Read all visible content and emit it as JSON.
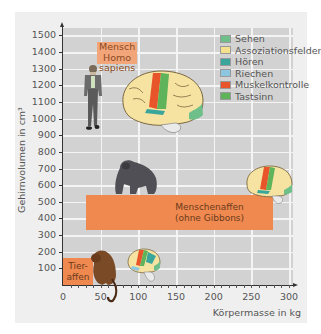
{
  "chart_data": {
    "type": "scatter",
    "title": "",
    "xlabel": "Körpermasse in kg",
    "ylabel": "Gehirnvolumen in cm³",
    "xlim": [
      0,
      300
    ],
    "ylim": [
      0,
      1500
    ],
    "grid": true,
    "legend_position": "top-right",
    "x_ticks": [
      "0",
      "50",
      "100",
      "150",
      "200",
      "250",
      "300"
    ],
    "y_ticks": [
      "100",
      "200",
      "300",
      "400",
      "500",
      "600",
      "700",
      "800",
      "900",
      "1000",
      "1100",
      "1200",
      "1300",
      "1400",
      "1500"
    ],
    "legend": [
      {
        "label": "Sehen",
        "color": "#6fbf8a"
      },
      {
        "label": "Assoziationsfelder",
        "color": "#f5e08e"
      },
      {
        "label": "Hören",
        "color": "#3aa59a"
      },
      {
        "label": "Riechen",
        "color": "#8cc6e0"
      },
      {
        "label": "Muskelkontrolle",
        "color": "#e8552a"
      },
      {
        "label": "Tastsinn",
        "color": "#5fb35a"
      }
    ],
    "groups": [
      {
        "name": "Mensch Homo sapiens",
        "body_mass_kg": [
          55,
          80
        ],
        "brain_volume_cm3": [
          1200,
          1400
        ],
        "label_lines": [
          "Mensch",
          "Homo",
          "sapiens"
        ]
      },
      {
        "name": "Menschenaffen (ohne Gibbons)",
        "body_mass_kg": [
          30,
          275
        ],
        "brain_volume_cm3": [
          340,
          540
        ],
        "label_lines": [
          "Menschenaffen",
          "(ohne Gibbons)"
        ]
      },
      {
        "name": "Tieraffen",
        "body_mass_kg": [
          0,
          30
        ],
        "brain_volume_cm3": [
          0,
          160
        ],
        "label_lines": [
          "Tier-",
          "affen"
        ]
      }
    ],
    "annotations": [
      "Mensch Homo sapiens",
      "Menschenaffen (ohne Gibbons)",
      "Tieraffen"
    ]
  },
  "colors": {
    "panel_bg": "#efefef",
    "plot_bg": "#d2d2d2",
    "grid": "#f4f4f4",
    "group_box": "#f0894f"
  }
}
